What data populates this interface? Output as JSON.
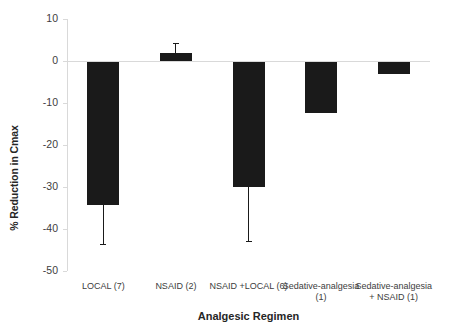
{
  "chart_data": {
    "type": "bar",
    "title": "",
    "xlabel": "Analgesic Regimen",
    "ylabel": "% Reduction in Cmax",
    "categories": [
      "LOCAL (7)",
      "NSAID (2)",
      "NSAID +LOCAL (6)",
      "Sedative-analgesia (1)",
      "Sedative-analgesia + NSAID (1)"
    ],
    "category_lines": [
      [
        "LOCAL (7)"
      ],
      [
        "NSAID (2)"
      ],
      [
        "NSAID +LOCAL (6)"
      ],
      [
        "Sedative-analgesia",
        "(1)"
      ],
      [
        "Sedative-analgesia",
        "+ NSAID (1)"
      ]
    ],
    "values": [
      -34.3,
      2.0,
      -30.0,
      -12.4,
      -3.0
    ],
    "errors_low": [
      -43.6,
      null,
      -42.8,
      null,
      null
    ],
    "errors_high": [
      null,
      4.3,
      null,
      null,
      null
    ],
    "ylim": [
      -50,
      10
    ],
    "yticks": [
      10,
      0,
      -10,
      -20,
      -30,
      -40,
      -50
    ],
    "ytick_labels": [
      "10",
      "0",
      "-10",
      "-20",
      "-30",
      "-40",
      "-50"
    ],
    "grid": false,
    "legend": false,
    "bar_color": "#1a1a1a",
    "axis_color": "#d9d9d9",
    "text_color": "#3d3d3d"
  }
}
